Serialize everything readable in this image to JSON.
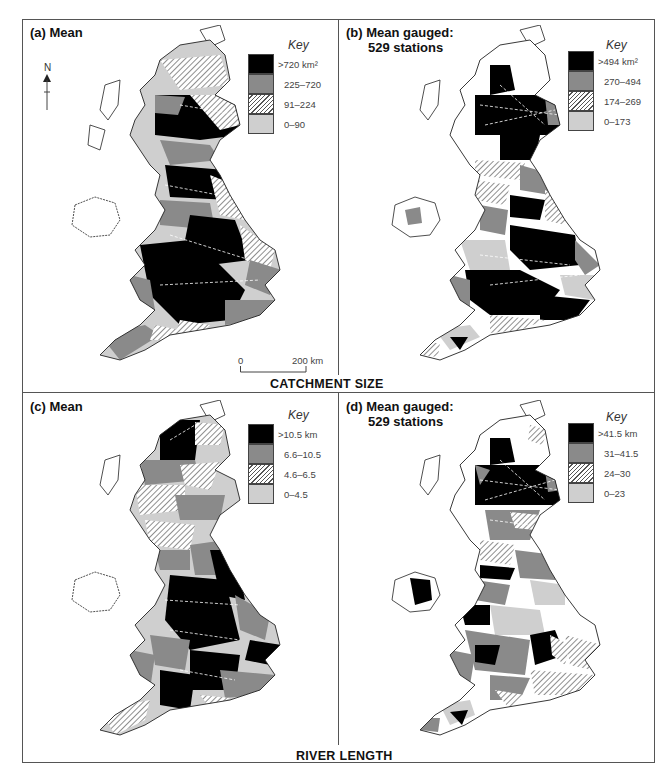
{
  "figure": {
    "sections": [
      {
        "title": "CATCHMENT SIZE",
        "panels": [
          {
            "id": "a",
            "title_line1": "(a) Mean",
            "title_line2": "",
            "key_title": "Key",
            "key": [
              {
                "label": ">720 km²",
                "fill": "black"
              },
              {
                "label": "225–720",
                "fill": "grey"
              },
              {
                "label": "91–224",
                "fill": "hatch"
              },
              {
                "label": "0–90",
                "fill": "light"
              }
            ],
            "north_label": "N",
            "scale_bar": {
              "start": "0",
              "end": "200 km"
            }
          },
          {
            "id": "b",
            "title_line1": "(b) Mean gauged:",
            "title_line2": "529 stations",
            "key_title": "Key",
            "key": [
              {
                "label": ">494 km²",
                "fill": "black"
              },
              {
                "label": "270–494",
                "fill": "grey"
              },
              {
                "label": "174–269",
                "fill": "hatch"
              },
              {
                "label": "0–173",
                "fill": "light"
              }
            ]
          }
        ]
      },
      {
        "title": "RIVER LENGTH",
        "panels": [
          {
            "id": "c",
            "title_line1": "(c) Mean",
            "title_line2": "",
            "key_title": "Key",
            "key": [
              {
                "label": ">10.5 km",
                "fill": "black"
              },
              {
                "label": "6.6–10.5",
                "fill": "grey"
              },
              {
                "label": "4.6–6.5",
                "fill": "hatch"
              },
              {
                "label": "0–4.5",
                "fill": "light"
              }
            ]
          },
          {
            "id": "d",
            "title_line1": "(d) Mean gauged:",
            "title_line2": "529 stations",
            "key_title": "Key",
            "key": [
              {
                "label": ">41.5 km",
                "fill": "black"
              },
              {
                "label": "31–41.5",
                "fill": "grey"
              },
              {
                "label": "24–30",
                "fill": "hatch"
              },
              {
                "label": "0–23",
                "fill": "light"
              }
            ]
          }
        ]
      }
    ]
  },
  "colors": {
    "black": "#000000",
    "grey": "#8a8a8a",
    "hatch": "#555555",
    "light": "#cfcfcf",
    "frame": "#555555"
  }
}
